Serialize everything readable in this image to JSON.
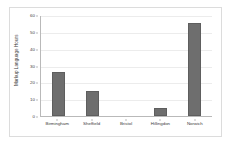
{
  "chart_data": {
    "type": "bar",
    "title": "",
    "subtitle": "",
    "xlabel": "",
    "ylabel": "Markup Language Hours",
    "categories": [
      "Birmingham",
      "Sheffield",
      "Bristol",
      "Hillingdon",
      "Norwich"
    ],
    "values": [
      26,
      15,
      0,
      5,
      55
    ],
    "series": [
      {
        "name": "Markup Language Hours",
        "values": [
          26,
          15,
          0,
          5,
          55
        ]
      }
    ],
    "ylim": [
      0,
      60
    ],
    "yticks": [
      0,
      10,
      20,
      30,
      40,
      50,
      60
    ],
    "ytick_labels": [
      "0",
      "10",
      "20",
      "30",
      "40",
      "50",
      "60"
    ],
    "grid": true,
    "grid_axis": "y",
    "legend": false,
    "legend_position": "none",
    "bar_color": "#6e6e6e",
    "gridline_color": "#ececec",
    "axis_color": "#b9b9b9",
    "background_color": "#ffffff",
    "frame_border_color": "#dcdcdc",
    "annotations": []
  }
}
